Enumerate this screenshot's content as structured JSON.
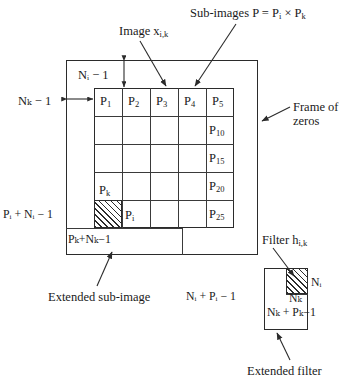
{
  "diagram": {
    "annotations": {
      "image_label": "Image x",
      "image_label_sub": "i,k",
      "subimages_label": "Sub-images P = P",
      "subimages_label_sub1": "i",
      "subimages_label_mid": " × P",
      "subimages_label_sub2": "k",
      "frame_of_zeros_line1": "Frame of",
      "frame_of_zeros_line2": "zeros",
      "extended_subimage": "Extended sub-image",
      "extended_filter": "Extended filter",
      "filter_label": "Filter h",
      "filter_label_sub": "i,k"
    },
    "dimensions": {
      "ni_minus_1": "Nᵢ − 1",
      "nk_minus_1": "Nₖ − 1",
      "pi_plus_ni_minus_1": "Pᵢ + Nᵢ − 1",
      "pk_plus_nk_minus_1": "Pₖ+Nₖ−1",
      "ni_plus_pi_minus_1": "Nᵢ + Pᵢ − 1",
      "nk_plus_pk_minus_1": "Nₖ + Pₖ−1",
      "ni": "Nᵢ",
      "nk": "Nₖ"
    },
    "grid": {
      "rows": 5,
      "cols": 5,
      "cells": [
        [
          "P1",
          "P2",
          "P3",
          "P4",
          "P5"
        ],
        [
          "",
          "",
          "",
          "",
          "P10"
        ],
        [
          "",
          "",
          "",
          "",
          "P15"
        ],
        [
          "",
          "",
          "",
          "",
          "P20"
        ],
        [
          "",
          "",
          "",
          "",
          "P25"
        ]
      ],
      "cell_labels": {
        "r1c1": "P",
        "r1c1s": "1",
        "r1c2": "P",
        "r1c2s": "2",
        "r1c3": "P",
        "r1c3s": "3",
        "r1c4": "P",
        "r1c4s": "4",
        "r1c5": "P",
        "r1c5s": "5",
        "r2c5": "P",
        "r2c5s": "10",
        "r3c5": "P",
        "r3c5s": "15",
        "r4c5": "P",
        "r4c5s": "20",
        "r5c5": "P",
        "r5c5s": "25"
      },
      "highlight_cell_row": 5,
      "highlight_cell_col": 1,
      "pk_marker": "P",
      "pk_marker_sub": "k",
      "pi_marker": "P",
      "pi_marker_sub": "i"
    },
    "colors": {
      "ink": "#1a1a1a",
      "stroke": "#2b2b2b",
      "grid_stroke": "#3a3a3a",
      "background": "#ffffff"
    }
  }
}
